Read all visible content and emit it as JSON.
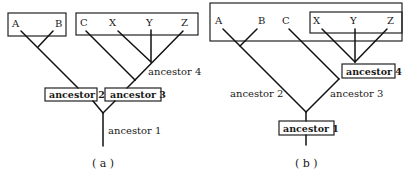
{
  "panel_a": {
    "caption": "( a )",
    "box1_leaves": [
      "A",
      "B"
    ],
    "box2_leaves": [
      "C",
      "X",
      "Y",
      "Z"
    ],
    "ancestor_1": "ancestor 1",
    "ancestor_2": "ancestor 2",
    "ancestor_3": "ancestor 3",
    "ancestor_4": "ancestor 4"
  },
  "panel_b": {
    "caption": "( b )",
    "outer_leaves": [
      "A",
      "B",
      "C"
    ],
    "inner_leaves": [
      "X",
      "Y",
      "Z"
    ],
    "ancestor_1": "ancestor 1",
    "ancestor_2": "ancestor 2",
    "ancestor_3": "ancestor 3",
    "ancestor_4": "ancestor 4"
  }
}
